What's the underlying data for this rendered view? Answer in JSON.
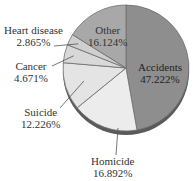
{
  "chart_data": {
    "type": "pie",
    "title": "",
    "start_angle_deg": 0,
    "direction": "clockwise",
    "slices": [
      {
        "label": "Accidents",
        "value": 47.222,
        "value_label": "47.222%",
        "color": "#8e8e8e"
      },
      {
        "label": "Homicide",
        "value": 16.892,
        "value_label": "16.892%",
        "color": "#ececec"
      },
      {
        "label": "Suicide",
        "value": 12.226,
        "value_label": "12.226%",
        "color": "#e4e4e4"
      },
      {
        "label": "Cancer",
        "value": 4.671,
        "value_label": "4.671%",
        "color": "#d8d8d8"
      },
      {
        "label": "Heart disease",
        "value": 2.865,
        "value_label": "2.865%",
        "color": "#cfcfcf"
      },
      {
        "label": "Other",
        "value": 16.124,
        "value_label": "16.124%",
        "color": "#a8a8a8"
      }
    ],
    "categories": [
      "Accidents",
      "Homicide",
      "Suicide",
      "Cancer",
      "Heart disease",
      "Other"
    ],
    "values": [
      47.222,
      16.892,
      12.226,
      4.671,
      2.865,
      16.124
    ]
  },
  "labels": {
    "accidents": {
      "name": "Accidents",
      "pct": "47.222%"
    },
    "homicide": {
      "name": "Homicide",
      "pct": "16.892%"
    },
    "suicide": {
      "name": "Suicide",
      "pct": "12.226%"
    },
    "cancer": {
      "name": "Cancer",
      "pct": "4.671%"
    },
    "heart": {
      "name": "Heart disease",
      "pct": "2.865%"
    },
    "other": {
      "name": "Other",
      "pct": "16.124%"
    }
  },
  "style": {
    "slice_edge": "#6e6e6e",
    "rim_dark": "#5a5a5a",
    "leader_line": "#555555"
  }
}
